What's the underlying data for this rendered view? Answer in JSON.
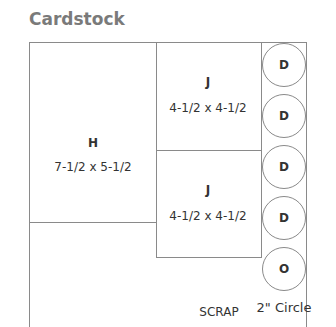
{
  "title": "Cardstock",
  "pieces": {
    "h": {
      "letter": "H",
      "size": "7-1/2 x 5-1/2"
    },
    "j1": {
      "letter": "J",
      "size": "4-1/2 x 4-1/2"
    },
    "j2": {
      "letter": "J",
      "size": "4-1/2 x 4-1/2"
    }
  },
  "circles": [
    "D",
    "D",
    "D",
    "D",
    "O"
  ],
  "circle_caption": "2\" Circle",
  "scrap_label": "SCRAP",
  "colors": {
    "line": "#8a8a8a",
    "title": "#7a7a7a",
    "text": "#333333"
  }
}
